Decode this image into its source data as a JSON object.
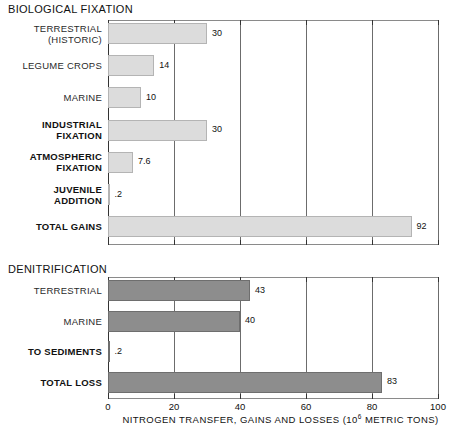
{
  "chart_data": {
    "type": "bar",
    "orientation": "horizontal",
    "title": "",
    "xlabel": "NITROGEN TRANSFER, GAINS AND LOSSES (10⁶ METRIC TONS)",
    "ylabel": "",
    "xlim": [
      0,
      100
    ],
    "xticks": [
      0,
      20,
      40,
      60,
      80,
      100
    ],
    "xtick_labels": [
      "0",
      "20",
      "40",
      "60",
      "80",
      "100"
    ],
    "grid": true,
    "grid_axis": "x",
    "legend": "none",
    "units": "10^6 metric tons",
    "panels": [
      {
        "name": "BIOLOGICAL FIXATION",
        "bar_color": "#dcdcdc",
        "categories": [
          "TERRESTRIAL\n(HISTORIC)",
          "LEGUME CROPS",
          "MARINE",
          "INDUSTRIAL\nFIXATION",
          "ATMOSPHERIC\nFIXATION",
          "JUVENILE\nADDITION",
          "TOTAL GAINS"
        ],
        "values": [
          30,
          14,
          10,
          30,
          7.6,
          0.2,
          92
        ],
        "value_labels": [
          "30",
          "14",
          "10",
          "30",
          "7.6",
          ".2",
          "92"
        ],
        "bold_flags": [
          false,
          false,
          false,
          true,
          true,
          true,
          true
        ]
      },
      {
        "name": "DENITRIFICATION",
        "bar_color": "#8d8d8d",
        "categories": [
          "TERRESTRIAL",
          "MARINE",
          "TO SEDIMENTS",
          "TOTAL LOSS"
        ],
        "values": [
          43,
          40,
          0.2,
          83
        ],
        "value_labels": [
          "43",
          "40",
          ".2",
          "83"
        ],
        "bold_flags": [
          false,
          false,
          true,
          true
        ]
      }
    ]
  },
  "headers": {
    "biological": "BIOLOGICAL FIXATION",
    "denitrification": "DENITRIFICATION"
  },
  "axis": {
    "title_main": "NITROGEN TRANSFER, GAINS AND LOSSES (10",
    "title_sup": "6",
    "title_tail": " METRIC TONS)",
    "ticks": [
      "0",
      "20",
      "40",
      "60",
      "80",
      "100"
    ]
  },
  "rows_top": [
    {
      "label": "TERRESTRIAL\n(HISTORIC)",
      "value_label": "30"
    },
    {
      "label": "LEGUME CROPS",
      "value_label": "14"
    },
    {
      "label": "MARINE",
      "value_label": "10"
    },
    {
      "label": "INDUSTRIAL\nFIXATION",
      "value_label": "30"
    },
    {
      "label": "ATMOSPHERIC\nFIXATION",
      "value_label": "7.6"
    },
    {
      "label": "JUVENILE\nADDITION",
      "value_label": ".2"
    },
    {
      "label": "TOTAL GAINS",
      "value_label": "92"
    }
  ],
  "rows_bottom": [
    {
      "label": "TERRESTRIAL",
      "value_label": "43"
    },
    {
      "label": "MARINE",
      "value_label": "40"
    },
    {
      "label": "TO SEDIMENTS",
      "value_label": ".2"
    },
    {
      "label": "TOTAL LOSS",
      "value_label": "83"
    }
  ]
}
